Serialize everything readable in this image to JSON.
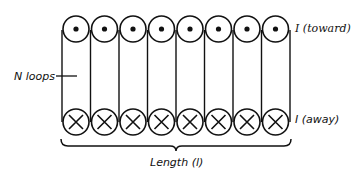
{
  "diagram": {
    "loop_count_shown": 8,
    "top_row": {
      "symbol": "dot",
      "meaning": "current toward viewer"
    },
    "bottom_row": {
      "symbol": "cross",
      "meaning": "current away from viewer"
    },
    "labels": {
      "current_toward": "I (toward)",
      "current_away": "I (away)",
      "n_loops": "N loops",
      "length": "Length (l)"
    },
    "colors": {
      "ink": "#111111",
      "background": "#ffffff"
    }
  }
}
